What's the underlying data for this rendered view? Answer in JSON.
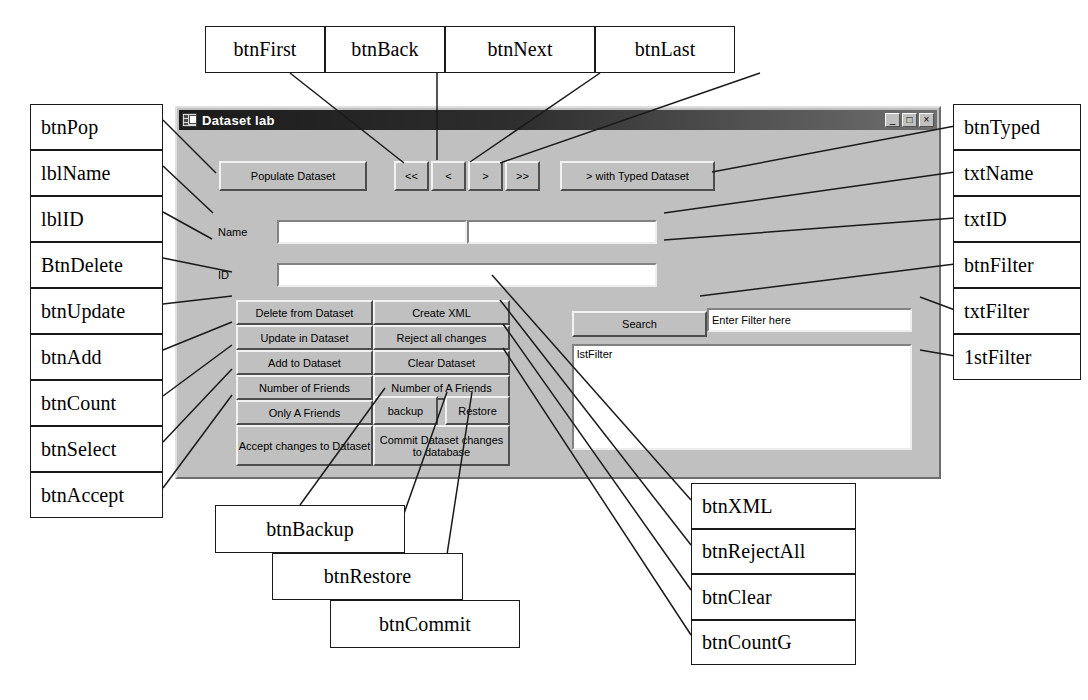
{
  "figure": {
    "kind": "annotated-screenshot-diagram"
  },
  "window": {
    "title": "Dataset lab",
    "icon": "form-window-icon",
    "controls": {
      "minimize": "_",
      "maximize": "□",
      "close": "×"
    }
  },
  "form": {
    "buttons": {
      "populate": "Populate Dataset",
      "first": "<<",
      "back": "<",
      "next": ">",
      "last": ">>",
      "typed": "> with Typed Dataset",
      "delete": "Delete from Dataset",
      "create_xml": "Create XML",
      "update": "Update in Dataset",
      "reject_all": "Reject all changes",
      "add": "Add to Dataset",
      "clear": "Clear Dataset",
      "count_friends": "Number of Friends",
      "count_a_friends": "Number of A Friends",
      "only_a_friends": "Only A Friends",
      "backup": "backup",
      "restore": "Restore",
      "accept": "Accept changes to Dataset",
      "commit": "Commit Dataset changes to database",
      "search": "Search"
    },
    "labels": {
      "name": "Name",
      "id": "ID"
    },
    "fields": {
      "name_a": "",
      "name_b": "",
      "id": "",
      "filter": "Enter Filter here"
    },
    "listbox": {
      "placeholder_text": "lstFilter",
      "items": []
    }
  },
  "callouts": {
    "top": [
      {
        "name": "btnFirst"
      },
      {
        "name": "btnBack"
      },
      {
        "name": "btnNext"
      },
      {
        "name": "btnLast"
      }
    ],
    "left": [
      {
        "name": "btnPop"
      },
      {
        "name": "lblName"
      },
      {
        "name": "lblID"
      },
      {
        "name": "BtnDelete"
      },
      {
        "name": "btnUpdate"
      },
      {
        "name": "btnAdd"
      },
      {
        "name": "btnCount"
      },
      {
        "name": "btnSelect"
      },
      {
        "name": "btnAccept"
      }
    ],
    "right": [
      {
        "name": "btnTyped"
      },
      {
        "name": "txtName"
      },
      {
        "name": "txtID"
      },
      {
        "name": "btnFilter"
      },
      {
        "name": "txtFilter"
      },
      {
        "name": "1stFilter"
      }
    ],
    "bottom_left": [
      {
        "name": "btnBackup"
      },
      {
        "name": "btnRestore"
      },
      {
        "name": "btnCommit"
      }
    ],
    "bottom_right": [
      {
        "name": "btnXML"
      },
      {
        "name": "btnRejectAll"
      },
      {
        "name": "btnClear"
      },
      {
        "name": "btnCountG"
      }
    ]
  },
  "colors": {
    "form_face": "#c0c0c0",
    "titlebar_dark": "#1b1b1b",
    "callout_border": "#1a1a1a",
    "page_bg": "#ffffff"
  }
}
